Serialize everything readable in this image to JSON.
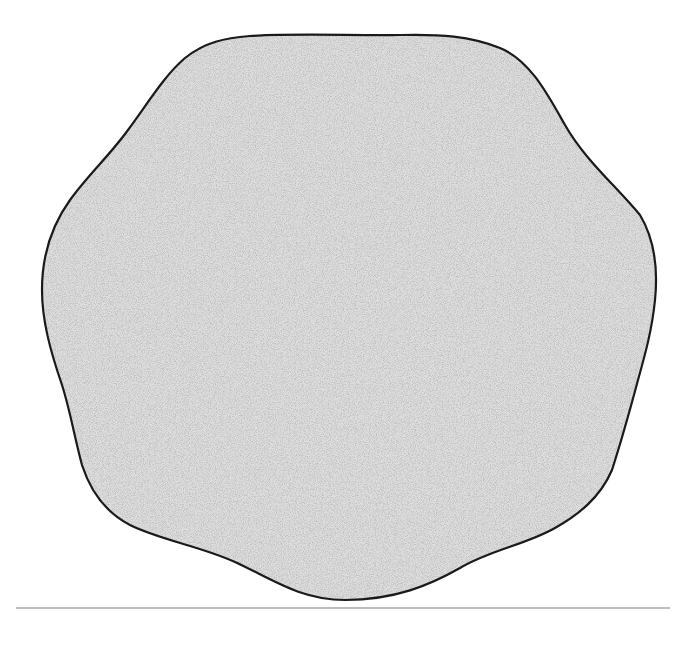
{
  "figure": {
    "shape": "rounded-irregular-heptagon-blob",
    "fill_style": "stipple",
    "colors": {
      "background": "#ffffff",
      "fill_base": "#d9d9d9",
      "stipple_dot": "#8a8a8a",
      "outline": "#1a1a1a",
      "rule": "#7a7a7a"
    },
    "outline_width": 2.2,
    "rule": {
      "y": 608,
      "x1": 16,
      "x2": 670,
      "width": 1.2
    }
  }
}
